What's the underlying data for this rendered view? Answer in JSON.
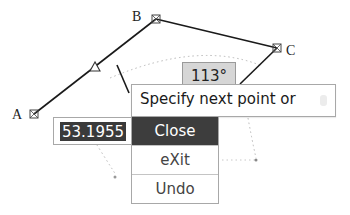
{
  "drawing": {
    "points": [
      {
        "label": "A",
        "x": 34,
        "y": 114
      },
      {
        "label": "B",
        "x": 156,
        "y": 19
      },
      {
        "label": "C",
        "x": 277,
        "y": 48
      }
    ],
    "midpoint_marker": "triangle"
  },
  "tooltips": {
    "angle": "113°",
    "prompt": "Specify next point or",
    "length": "53.1955"
  },
  "menu": {
    "items": [
      {
        "label": "Close",
        "active": true
      },
      {
        "label": "eXit",
        "active": false
      },
      {
        "label": "Undo",
        "active": false
      }
    ]
  },
  "colors": {
    "line": "#1a1a1a",
    "highlight": "#3d3d3d",
    "angle_bg": "#d6d6d6"
  }
}
